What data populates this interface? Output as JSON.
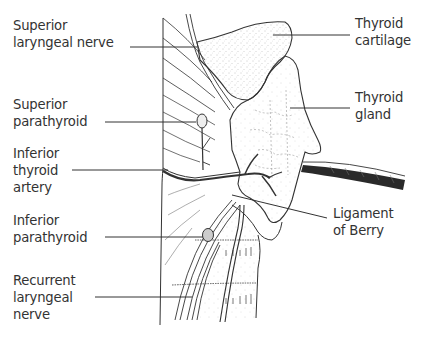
{
  "diagram": {
    "type": "anatomical-illustration",
    "ink_color": "#333333",
    "background": "#ffffff",
    "labels_left": [
      {
        "id": "superior-laryngeal-nerve",
        "lines": [
          "Superior",
          "laryngeal nerve"
        ]
      },
      {
        "id": "superior-parathyroid",
        "lines": [
          "Superior",
          "parathyroid"
        ]
      },
      {
        "id": "inferior-thyroid-artery",
        "lines": [
          "Inferior",
          "thyroid",
          "artery"
        ]
      },
      {
        "id": "inferior-parathyroid",
        "lines": [
          "Inferior",
          "parathyroid"
        ]
      },
      {
        "id": "recurrent-laryngeal-nerve",
        "lines": [
          "Recurrent",
          "laryngeal",
          "nerve"
        ]
      }
    ],
    "labels_right": [
      {
        "id": "thyroid-cartilage",
        "lines": [
          "Thyroid",
          "cartilage"
        ]
      },
      {
        "id": "thyroid-gland",
        "lines": [
          "Thyroid",
          "gland"
        ]
      },
      {
        "id": "ligament-of-berry",
        "lines": [
          "Ligament",
          "of Berry"
        ]
      }
    ]
  }
}
